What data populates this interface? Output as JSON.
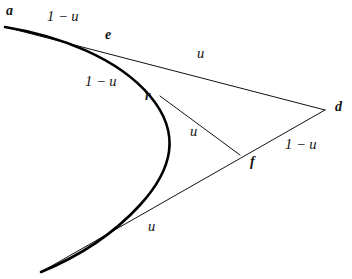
{
  "figure": {
    "kind": "geometric-diagram",
    "background_color": "#ffffff",
    "stroke_color": "#111111",
    "curve_stroke_color": "#000000",
    "curve_stroke_width": 2.6,
    "line_stroke_width": 1.0
  },
  "points": [
    {
      "id": "a",
      "label": "a",
      "x": 5,
      "y": 27,
      "label_x": 6,
      "label_y": 4
    },
    {
      "id": "e",
      "label": "e",
      "x": 97,
      "y": 46,
      "label_x": 105,
      "label_y": 28
    },
    {
      "id": "r",
      "label": "r",
      "x": 160,
      "y": 96,
      "label_x": 145,
      "label_y": 89
    },
    {
      "id": "f",
      "label": "f",
      "x": 240,
      "y": 155,
      "label_x": 250,
      "label_y": 155
    },
    {
      "id": "d",
      "label": "d",
      "x": 325,
      "y": 110,
      "label_x": 335,
      "label_y": 100
    },
    {
      "id": "b",
      "label": "",
      "x": 41,
      "y": 272,
      "label_x": 0,
      "label_y": 0
    }
  ],
  "segments": [
    {
      "id": "a-e-d",
      "name": "upper-chord",
      "from": "a",
      "to": "d",
      "via": "e"
    },
    {
      "id": "r-f",
      "name": "middle-chord",
      "from": "r",
      "to": "f"
    },
    {
      "id": "d-f-b",
      "name": "lower-chord",
      "from": "d",
      "to": "b",
      "via": "f"
    }
  ],
  "curve": {
    "name": "bezier-curve",
    "path": "M 5,27 C 60,36 118,58 150,96 C 182,134 172,170 140,205 C 108,240 70,260 41,272"
  },
  "ratio_labels": [
    {
      "id": "ae",
      "text": "1 − u",
      "x": 47,
      "y": 9,
      "on_segment": "a-e"
    },
    {
      "id": "er",
      "text": "1 − u",
      "x": 85,
      "y": 74,
      "on_segment": "e-r"
    },
    {
      "id": "ed",
      "text": "u",
      "x": 197,
      "y": 46,
      "on_segment": "e-d"
    },
    {
      "id": "rf",
      "text": "u",
      "x": 190,
      "y": 124,
      "on_segment": "r-f"
    },
    {
      "id": "fd",
      "text": "1 − u",
      "x": 285,
      "y": 137,
      "on_segment": "f-d"
    },
    {
      "id": "bf",
      "text": "u",
      "x": 148,
      "y": 219,
      "on_segment": "b-f"
    }
  ]
}
